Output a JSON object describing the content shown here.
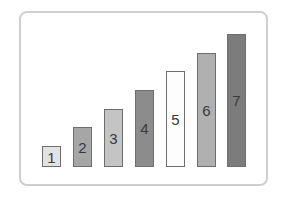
{
  "chart_data": {
    "type": "bar",
    "title": "",
    "xlabel": "",
    "ylabel": "",
    "grid": false,
    "legend": "none",
    "categories": [
      "1",
      "2",
      "3",
      "4",
      "5",
      "6",
      "7"
    ],
    "values": [
      1,
      2,
      3,
      4,
      5,
      6,
      7
    ],
    "ylim": [
      0,
      7
    ],
    "bar_labels": [
      "1",
      "2",
      "3",
      "4",
      "5",
      "6",
      "7"
    ],
    "bar_colors": [
      "#e2e2e2",
      "#a6a6a6",
      "#c4c4c4",
      "#8c8c8c",
      "#fdfdfd",
      "#b0b0b0",
      "#7c7c7c"
    ]
  },
  "bars": [
    {
      "label": "1",
      "left": 42,
      "top": 146,
      "color": "#e2e2e2"
    },
    {
      "label": "2",
      "left": 73,
      "top": 127,
      "color": "#a6a6a6"
    },
    {
      "label": "3",
      "left": 104,
      "top": 109,
      "color": "#c4c4c4"
    },
    {
      "label": "4",
      "left": 135,
      "top": 90,
      "color": "#8c8c8c"
    },
    {
      "label": "5",
      "left": 166,
      "top": 71,
      "color": "#fdfdfd"
    },
    {
      "label": "6",
      "left": 197,
      "top": 53,
      "color": "#b0b0b0"
    },
    {
      "label": "7",
      "left": 227,
      "top": 34,
      "color": "#7c7c7c"
    }
  ],
  "baseline": 167
}
